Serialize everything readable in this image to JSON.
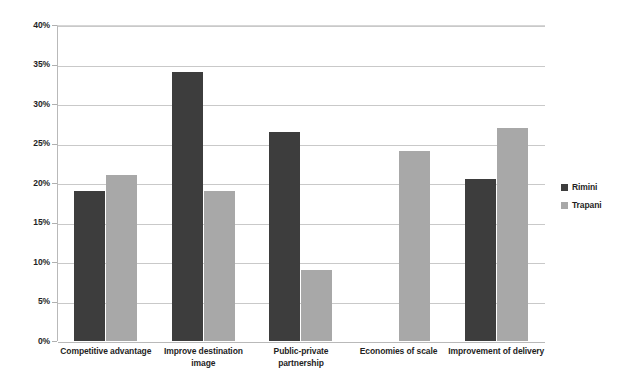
{
  "chart_data": {
    "type": "bar",
    "title": "",
    "subtitle": "",
    "xlabel": "",
    "ylabel": "",
    "ylim": [
      0,
      40
    ],
    "ytick_labels": [
      "40%",
      "35%",
      "30%",
      "25%",
      "20%",
      "15%",
      "10%",
      "5%",
      "0%"
    ],
    "ytick_values": [
      40,
      35,
      30,
      25,
      20,
      15,
      10,
      5,
      0
    ],
    "grid": true,
    "legend_position": "right",
    "categories": [
      "Competitive advantage",
      "Improve destination image",
      "Public-private partnership",
      "Economies of scale",
      "Improvement of delivery"
    ],
    "series": [
      {
        "name": "Rimini",
        "color": "#3d3d3d",
        "values": [
          19.0,
          34.0,
          26.5,
          null,
          20.5
        ]
      },
      {
        "name": "Trapani",
        "color": "#a8a8a8",
        "values": [
          21.0,
          19.0,
          9.0,
          24.0,
          27.0
        ]
      }
    ]
  },
  "legend": {
    "entries": [
      {
        "label": "Rimini",
        "color": "#3d3d3d"
      },
      {
        "label": "Trapani",
        "color": "#a8a8a8"
      }
    ]
  },
  "colors": {
    "series_rimini": "#3d3d3d",
    "series_trapani": "#a8a8a8",
    "gridline": "#c9c9c9",
    "axis": "#b9b9b9",
    "background": "#ffffff",
    "text": "#1f1f1f"
  }
}
